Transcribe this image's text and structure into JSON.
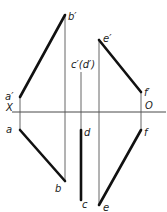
{
  "diagram": {
    "type": "orthographic-projection",
    "axis": {
      "left_label": "X",
      "right_label": "O"
    },
    "labels": {
      "a_prime": "a′",
      "b_prime": "b′",
      "a": "a",
      "b": "b",
      "cd_prime": "c′(d′)",
      "d": "d",
      "c": "c",
      "e_prime": "e′",
      "f_prime": "f′",
      "e": "e",
      "f": "f"
    },
    "lines": [
      {
        "name": "AB front view",
        "from": "a′",
        "to": "b′",
        "style": "thick"
      },
      {
        "name": "AB top view",
        "from": "a",
        "to": "b",
        "style": "thick"
      },
      {
        "name": "CD front view (point)",
        "at": "c′(d′)",
        "style": "thin"
      },
      {
        "name": "CD top view",
        "from": "d",
        "to": "c",
        "style": "thick"
      },
      {
        "name": "EF front view",
        "from": "e′",
        "to": "f′",
        "style": "thick"
      },
      {
        "name": "EF top view",
        "from": "f",
        "to": "e",
        "style": "thick"
      }
    ],
    "colors": {
      "line": "#111111",
      "projector": "#555555",
      "background": "#ffffff"
    }
  }
}
